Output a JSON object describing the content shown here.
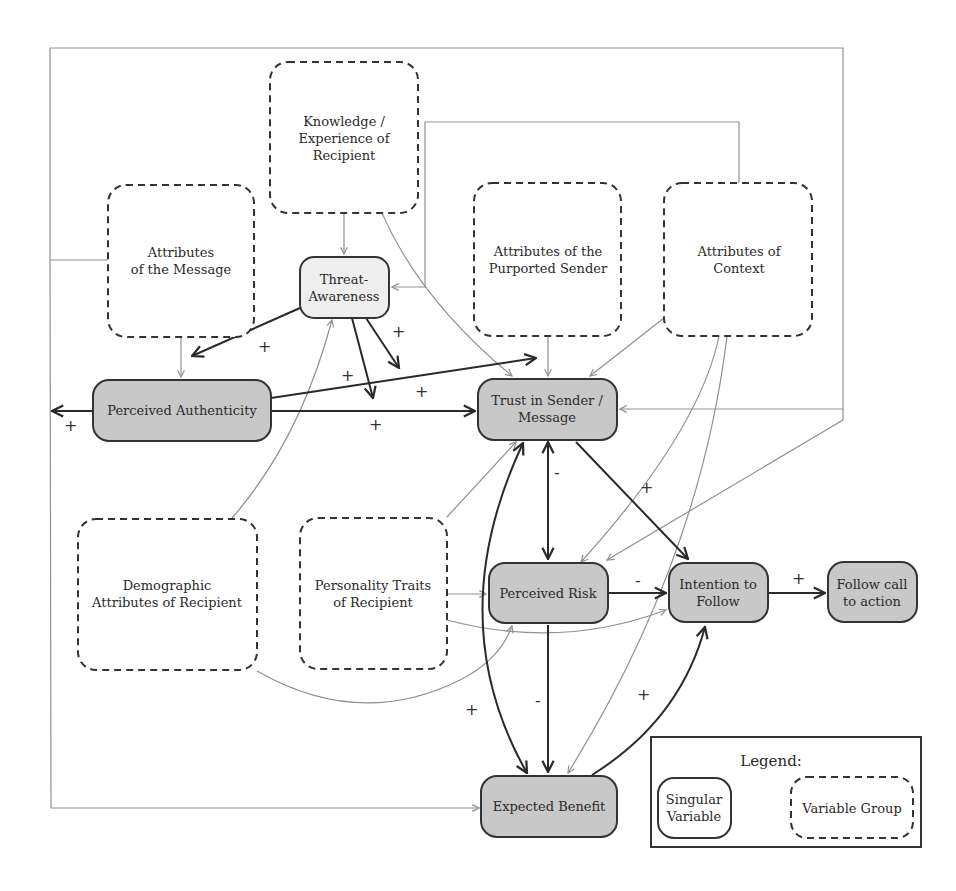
{
  "diagram": {
    "variable_groups": {
      "knowledge": {
        "line1": "Knowledge /",
        "line2": "Experience of",
        "line3": "Recipient"
      },
      "message": {
        "line1": "Attributes",
        "line2": "of the Message"
      },
      "sender": {
        "line1": "Attributes of the",
        "line2": "Purported Sender"
      },
      "context": {
        "line1": "Attributes of",
        "line2": "Context"
      },
      "demographic": {
        "line1": "Demographic",
        "line2": "Attributes of Recipient"
      },
      "personality": {
        "line1": "Personality Traits",
        "line2": "of Recipient"
      }
    },
    "variables": {
      "threat": {
        "line1": "Threat-",
        "line2": "Awareness"
      },
      "authenticity": {
        "label": "Perceived Authenticity"
      },
      "trust": {
        "line1": "Trust in Sender /",
        "line2": "Message"
      },
      "risk": {
        "label": "Perceived Risk"
      },
      "intention": {
        "line1": "Intention to",
        "line2": "Follow"
      },
      "follow": {
        "line1": "Follow call",
        "line2": "to action"
      },
      "benefit": {
        "label": "Expected Benefit"
      }
    },
    "edge_signs": {
      "threat_to_authenticity": "+",
      "threat_to_trust_a": "+",
      "threat_to_trust_b": "+",
      "threat_to_link": "+",
      "authenticity_to_trust": "+",
      "authenticity_to_left": "+",
      "trust_risk": "-",
      "trust_to_intention": "+",
      "risk_to_intention": "-",
      "intention_to_follow": "+",
      "risk_to_benefit": "-",
      "trust_benefit": "+",
      "benefit_to_intention": "+"
    },
    "legend": {
      "title": "Legend:",
      "singular_line1": "Singular",
      "singular_line2": "Variable",
      "group_label": "Variable Group"
    }
  }
}
